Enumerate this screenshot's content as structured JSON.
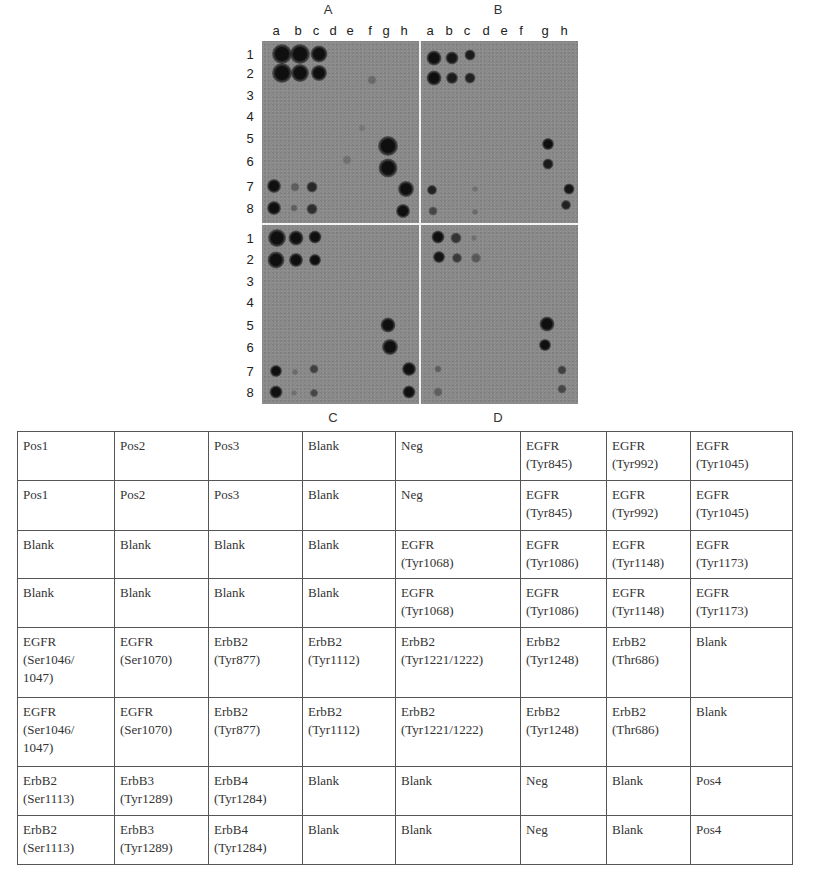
{
  "figure": {
    "panels": [
      {
        "id": "A",
        "label": "A",
        "label_x": 328,
        "label_y": 2
      },
      {
        "id": "B",
        "label": "B",
        "label_x": 498,
        "label_y": 2
      },
      {
        "id": "C",
        "label": "C",
        "label_x": 333,
        "label_y": 410
      },
      {
        "id": "D",
        "label": "D",
        "label_x": 498,
        "label_y": 410
      }
    ],
    "column_labels_left": [
      "a",
      "b",
      "c",
      "d",
      "e",
      "f",
      "g",
      "h"
    ],
    "column_labels_right": [
      "a",
      "b",
      "c",
      "d",
      "e",
      "f",
      "g",
      "h"
    ],
    "row_labels": [
      "1",
      "2",
      "3",
      "4",
      "5",
      "6",
      "7",
      "8"
    ],
    "colors": {
      "membrane": "#8a8a8a",
      "divider": "#f2f2f2",
      "spot": "#151515"
    }
  },
  "table": {
    "rows": [
      [
        "Pos1",
        "Pos2",
        "Pos3",
        "Blank",
        "Neg",
        "EGFR\n(Tyr845)",
        "EGFR\n(Tyr992)",
        "EGFR\n(Tyr1045)"
      ],
      [
        "Pos1",
        "Pos2",
        "Pos3",
        "Blank",
        "Neg",
        "EGFR\n(Tyr845)",
        "EGFR\n(Tyr992)",
        "EGFR\n(Tyr1045)"
      ],
      [
        "Blank",
        "Blank",
        "Blank",
        "Blank",
        "EGFR\n(Tyr1068)",
        "EGFR\n(Tyr1086)",
        "EGFR\n(Tyr1148)",
        "EGFR\n(Tyr1173)"
      ],
      [
        "Blank",
        "Blank",
        "Blank",
        "Blank",
        "EGFR\n(Tyr1068)",
        "EGFR\n(Tyr1086)",
        "EGFR\n(Tyr1148)",
        "EGFR\n(Tyr1173)"
      ],
      [
        "EGFR\n(Ser1046/\n1047)",
        "EGFR\n(Ser1070)",
        "ErbB2\n(Tyr877)",
        "ErbB2\n(Tyr1112)",
        "ErbB2\n(Tyr1221/1222)",
        "ErbB2\n(Tyr1248)",
        "ErbB2\n(Thr686)",
        "Blank"
      ],
      [
        "EGFR\n(Ser1046/\n1047)",
        "EGFR\n(Ser1070)",
        "ErbB2\n(Tyr877)",
        "ErbB2\n(Tyr1112)",
        "ErbB2\n(Tyr1221/1222)",
        "ErbB2\n(Tyr1248)",
        "ErbB2\n(Thr686)",
        "Blank"
      ],
      [
        "ErbB2\n(Ser1113)",
        "ErbB3\n(Tyr1289)",
        "ErbB4\n(Tyr1284)",
        "Blank",
        "Blank",
        "Neg",
        "Blank",
        "Pos4"
      ],
      [
        "ErbB2\n(Ser1113)",
        "ErbB3\n(Tyr1289)",
        "ErbB4\n(Tyr1284)",
        "Blank",
        "Blank",
        "Neg",
        "Blank",
        "Pos4"
      ]
    ]
  }
}
